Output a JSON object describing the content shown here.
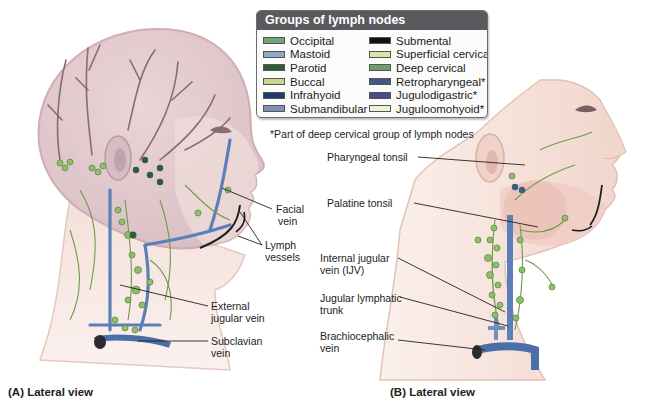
{
  "legend": {
    "title": "Groups of lymph nodes",
    "left_column": [
      {
        "label": "Occipital",
        "color": "#6fa37a"
      },
      {
        "label": "Mastoid",
        "color": "#8fa9c9"
      },
      {
        "label": "Parotid",
        "color": "#2f5d3a"
      },
      {
        "label": "Buccal",
        "color": "#c9d98c"
      },
      {
        "label": "Infrahyoid",
        "color": "#1f3b6e"
      },
      {
        "label": "Submandibular",
        "color": "#7f8fb8"
      }
    ],
    "right_column": [
      {
        "label": "Submental",
        "color": "#111111"
      },
      {
        "label": "Superficial cervical",
        "color": "#d8e6a6"
      },
      {
        "label": "Deep cervical",
        "color": "#6f9d6a"
      },
      {
        "label": "Retropharyngeal*",
        "color": "#3d5a85"
      },
      {
        "label": "Jugulodigastric*",
        "color": "#4a4a8c"
      },
      {
        "label": "Juguloomohyoid*",
        "color": "#eef2d6"
      }
    ]
  },
  "footnote": "*Part of deep cervical group of lymph nodes",
  "panel_a": {
    "caption": "(A) Lateral view",
    "labels": {
      "facial_vein": [
        "Facial",
        "vein"
      ],
      "lymph_vessels": [
        "Lymph",
        "vessels"
      ],
      "external_jugular_vein": [
        "External",
        "jugular vein"
      ],
      "subclavian_vein": [
        "Subclavian",
        "vein"
      ]
    }
  },
  "panel_b": {
    "caption": "(B) Lateral view",
    "labels": {
      "pharyngeal_tonsil": [
        "Pharyngeal tonsil"
      ],
      "palatine_tonsil": [
        "Palatine tonsil"
      ],
      "internal_jugular_vein": [
        "Internal jugular",
        "vein (IJV)"
      ],
      "jugular_lymphatic_trunk": [
        "Jugular lymphatic",
        "trunk"
      ],
      "brachiocephalic_vein": [
        "Brachiocephalic",
        "vein"
      ]
    }
  },
  "colors": {
    "skin": "#f3d9cf",
    "skin_edge": "#e2b8a8",
    "skull_tint": "#d9c3c8",
    "vein": "#5d7fb8",
    "lymph_node": "#8fbf6a",
    "lymph_vessel": "#6e9a4c",
    "dark_vessel": "#1d1d1d"
  }
}
